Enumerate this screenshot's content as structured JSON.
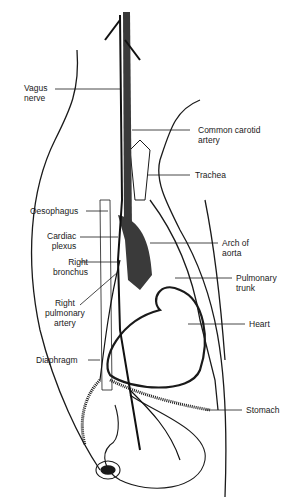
{
  "diagram": {
    "type": "anatomical illustration",
    "colors": {
      "ink": "#1a1a1a",
      "vessel": "#3a3a3a",
      "background": "#ffffff"
    },
    "labels_left": [
      {
        "id": "vagus",
        "text": "Vagus\nnerve"
      },
      {
        "id": "oesophagus",
        "text": "Oesophagus"
      },
      {
        "id": "cardiac",
        "text": "Cardiac\nplexus"
      },
      {
        "id": "bronchus",
        "text": "Right\nbronchus"
      },
      {
        "id": "rpa",
        "text": "Right\npulmonary\nartery"
      },
      {
        "id": "diaphragm",
        "text": "Diaphragm"
      }
    ],
    "labels_right": [
      {
        "id": "carotid",
        "text": "Common carotid\nartery"
      },
      {
        "id": "trachea",
        "text": "Trachea"
      },
      {
        "id": "arch",
        "text": "Arch of\naorta"
      },
      {
        "id": "pulm",
        "text": "Pulmonary\ntrunk"
      },
      {
        "id": "heart",
        "text": "Heart"
      },
      {
        "id": "stomach",
        "text": "Stomach"
      }
    ]
  }
}
